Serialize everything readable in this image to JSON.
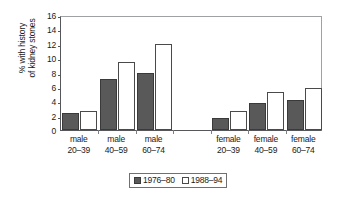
{
  "chart_data": {
    "type": "bar",
    "title": "",
    "xlabel": "",
    "ylabel_line1": "% with history",
    "ylabel_line2": "of kidney stones",
    "ylim": [
      0,
      16
    ],
    "yticks": [
      0,
      2,
      4,
      6,
      8,
      10,
      12,
      14,
      16
    ],
    "ytick_labels": [
      "0",
      "2",
      "4",
      "6",
      "8",
      "10",
      "12",
      "14",
      "16"
    ],
    "grid": false,
    "legend_position": "bottom-center",
    "categories": [
      {
        "line1": "male",
        "line2": "20–39"
      },
      {
        "line1": "male",
        "line2": "40–59"
      },
      {
        "line1": "male",
        "line2": "60–74"
      },
      {
        "line1": "",
        "line2": ""
      },
      {
        "line1": "female",
        "line2": "20–39"
      },
      {
        "line1": "female",
        "line2": "40–59"
      },
      {
        "line1": "female",
        "line2": "60–74"
      }
    ],
    "series": [
      {
        "name": "1976–80",
        "color": "#595959",
        "values": [
          2.4,
          7.1,
          7.9,
          null,
          1.7,
          3.8,
          4.2
        ]
      },
      {
        "name": "1988–94",
        "color": "#ffffff",
        "values": [
          2.7,
          9.4,
          11.9,
          null,
          2.7,
          5.3,
          5.9
        ]
      }
    ]
  },
  "legend": {
    "entries": [
      {
        "label": "1976–80"
      },
      {
        "label": "1988–94"
      }
    ]
  }
}
